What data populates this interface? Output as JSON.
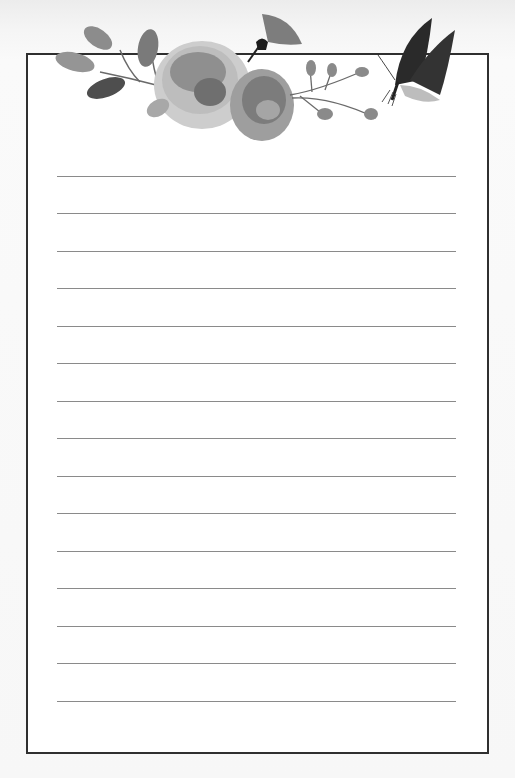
{
  "page": {
    "type": "lined stationery",
    "colors": {
      "background": "#f6f6f6",
      "paper": "#ffffff",
      "border": "#2f2f2f",
      "ruled_line": "#8a8a8a"
    }
  },
  "decoration": {
    "elements": [
      "leaf-branch-icon",
      "rose-icon",
      "rose-icon",
      "bellflower-icon",
      "rosehip-branch-icon",
      "butterfly-icon"
    ]
  },
  "ruled_lines": {
    "count": 15,
    "y_positions": [
      176,
      213,
      251,
      288,
      326,
      363,
      401,
      438,
      476,
      513,
      551,
      588,
      626,
      663,
      701
    ]
  }
}
